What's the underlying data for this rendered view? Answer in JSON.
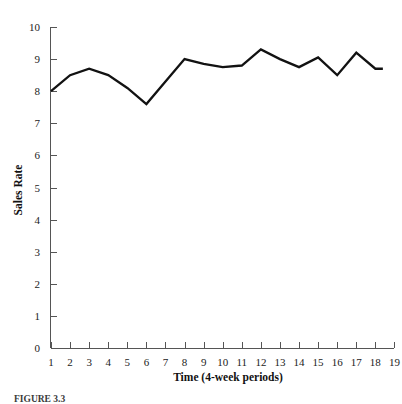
{
  "figure": {
    "caption": "FIGURE 3.3"
  },
  "chart_data": {
    "type": "line",
    "title": "",
    "xlabel": "Time (4-week periods)",
    "ylabel": "Sales Rate",
    "x": [
      1,
      2,
      3,
      4,
      5,
      6,
      7,
      8,
      9,
      10,
      11,
      12,
      13,
      14,
      15,
      16,
      17,
      18
    ],
    "values": [
      8.0,
      8.5,
      8.7,
      8.5,
      8.1,
      7.6,
      8.3,
      9.0,
      8.85,
      8.75,
      8.8,
      9.3,
      9.0,
      8.75,
      9.05,
      8.5,
      9.2,
      8.7
    ],
    "series": [
      {
        "name": "Sales Rate",
        "values": [
          8.0,
          8.5,
          8.7,
          8.5,
          8.1,
          7.6,
          8.3,
          9.0,
          8.85,
          8.75,
          8.8,
          9.3,
          9.0,
          8.75,
          9.05,
          8.5,
          9.2,
          8.7
        ]
      }
    ],
    "xlim": [
      1,
      19
    ],
    "ylim": [
      0,
      10
    ],
    "xticks": [
      "1",
      "2",
      "3",
      "4",
      "5",
      "6",
      "7",
      "8",
      "9",
      "10",
      "11",
      "12",
      "13",
      "14",
      "15",
      "16",
      "17",
      "18",
      "19"
    ],
    "yticks": [
      "0",
      "1",
      "2",
      "3",
      "4",
      "5",
      "6",
      "7",
      "8",
      "9",
      "10"
    ],
    "grid": false,
    "legend": false,
    "line_color": "#121212"
  }
}
